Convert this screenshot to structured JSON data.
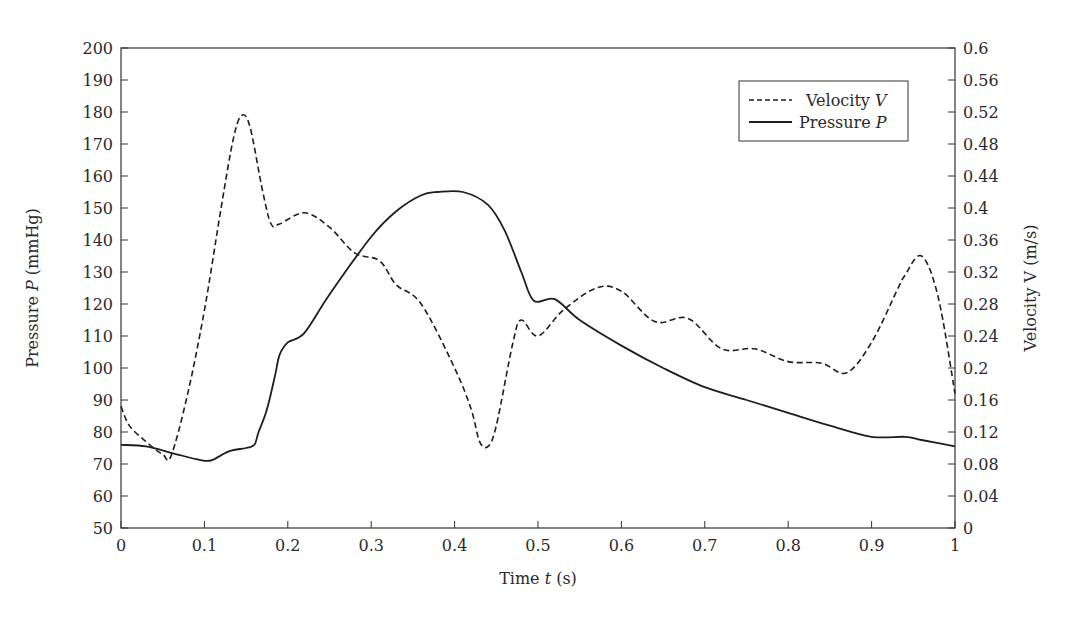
{
  "chart_data": {
    "type": "line",
    "title": "",
    "xlabel": "Time t (s)",
    "ylabel": "Pressure P (mmHg)",
    "y2label": "Velocity V (m/s)",
    "xlim": [
      0,
      1
    ],
    "ylim": [
      50,
      200
    ],
    "y2lim": [
      0,
      0.6
    ],
    "grid": false,
    "legend_position": "upper right",
    "x_ticks": [
      "0",
      "0.1",
      "0.2",
      "0.3",
      "0.4",
      "0.5",
      "0.6",
      "0.7",
      "0.8",
      "0.9",
      "1"
    ],
    "y_ticks": [
      "50",
      "60",
      "70",
      "80",
      "90",
      "100",
      "110",
      "120",
      "130",
      "140",
      "150",
      "160",
      "170",
      "180",
      "190",
      "200"
    ],
    "y2_ticks": [
      "0",
      "0.04",
      "0.08",
      "0.12",
      "0.16",
      "0.2",
      "0.24",
      "0.28",
      "0.32",
      "0.36",
      "0.4",
      "0.44",
      "0.48",
      "0.52",
      "0.56",
      "0.6"
    ],
    "series": [
      {
        "name": "Velocity V",
        "axis": "right",
        "style": "dashed",
        "x": [
          0,
          0.01,
          0.03,
          0.05,
          0.06,
          0.08,
          0.1,
          0.12,
          0.135,
          0.145,
          0.155,
          0.17,
          0.18,
          0.19,
          0.22,
          0.25,
          0.28,
          0.31,
          0.33,
          0.36,
          0.4,
          0.42,
          0.43,
          0.44,
          0.45,
          0.47,
          0.48,
          0.5,
          0.53,
          0.57,
          0.6,
          0.64,
          0.68,
          0.72,
          0.76,
          0.8,
          0.84,
          0.87,
          0.9,
          0.93,
          0.94,
          0.96,
          0.98,
          1.0
        ],
        "values": [
          0.152,
          0.128,
          0.108,
          0.092,
          0.09,
          0.168,
          0.272,
          0.4,
          0.488,
          0.516,
          0.5,
          0.42,
          0.38,
          0.38,
          0.394,
          0.376,
          0.344,
          0.334,
          0.304,
          0.28,
          0.2,
          0.148,
          0.108,
          0.102,
          0.128,
          0.232,
          0.26,
          0.24,
          0.272,
          0.3,
          0.296,
          0.258,
          0.262,
          0.224,
          0.224,
          0.208,
          0.206,
          0.194,
          0.232,
          0.296,
          0.316,
          0.34,
          0.288,
          0.168
        ]
      },
      {
        "name": "Pressure P",
        "axis": "left",
        "style": "solid",
        "x": [
          0,
          0.03,
          0.06,
          0.09,
          0.1,
          0.11,
          0.13,
          0.15,
          0.16,
          0.165,
          0.175,
          0.185,
          0.19,
          0.2,
          0.22,
          0.25,
          0.3,
          0.33,
          0.36,
          0.38,
          0.41,
          0.44,
          0.46,
          0.48,
          0.495,
          0.52,
          0.55,
          0.6,
          0.65,
          0.7,
          0.75,
          0.8,
          0.85,
          0.9,
          0.94,
          0.96,
          1.0
        ],
        "values": [
          76,
          75.5,
          73.5,
          71.5,
          71,
          71.3,
          74,
          75,
          76,
          80,
          87,
          98,
          104,
          108,
          111,
          123,
          141,
          149,
          154,
          155,
          155,
          151,
          143,
          130,
          121,
          121.5,
          115,
          107,
          100,
          94,
          90,
          86,
          82,
          78.5,
          78.5,
          77.5,
          75.5
        ]
      }
    ]
  },
  "legend": {
    "items": [
      {
        "label": "Velocity ",
        "var": "V",
        "style": "dashed"
      },
      {
        "label": "Pressure ",
        "var": "P",
        "style": "solid"
      }
    ]
  },
  "axes": {
    "x_title_text": "Time ",
    "x_title_var": "t",
    "x_title_unit": " (s)",
    "y_title_text": "Pressure ",
    "y_title_var": "P",
    "y_title_unit": " (mmHg)",
    "y2_title_text": "Velocity V (m/s)"
  },
  "colors": {
    "line": "#1e1e1e",
    "axis": "#333333"
  }
}
